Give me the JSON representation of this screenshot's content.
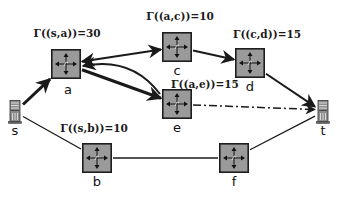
{
  "diagram": {
    "colors": {
      "router_fill": "#9a9a9a",
      "router_border": "#1e1e1e",
      "edge": "#1a1a1a",
      "server_fill": "#8c8c8c"
    },
    "nodes": [
      {
        "id": "s",
        "label": "s",
        "kind": "server",
        "icon": "server-icon"
      },
      {
        "id": "a",
        "label": "a",
        "kind": "router",
        "icon": "router-icon"
      },
      {
        "id": "c",
        "label": "c",
        "kind": "router",
        "icon": "router-icon"
      },
      {
        "id": "d",
        "label": "d",
        "kind": "router",
        "icon": "router-icon"
      },
      {
        "id": "e",
        "label": "e",
        "kind": "router",
        "icon": "router-icon"
      },
      {
        "id": "b",
        "label": "b",
        "kind": "router",
        "icon": "router-icon"
      },
      {
        "id": "f",
        "label": "f",
        "kind": "router",
        "icon": "router-icon"
      },
      {
        "id": "t",
        "label": "t",
        "kind": "server",
        "icon": "server-icon"
      }
    ],
    "capacity_labels": [
      {
        "edge": "s-a",
        "text": "Γ((s,a))=30"
      },
      {
        "edge": "a-c",
        "text": "Γ((a,c))=10"
      },
      {
        "edge": "c-d",
        "text": "Γ((c,d))=15"
      },
      {
        "edge": "a-e",
        "text": "Γ((a,e))=15"
      },
      {
        "edge": "s-b",
        "text": "Γ((s,b))=10"
      }
    ],
    "edges": [
      {
        "from": "s",
        "to": "a",
        "style": "thick-arrow"
      },
      {
        "from": "a",
        "to": "c",
        "style": "bidirectional-arrow"
      },
      {
        "from": "c",
        "to": "d",
        "style": "arrow"
      },
      {
        "from": "d",
        "to": "t",
        "style": "arrow"
      },
      {
        "from": "a",
        "to": "e",
        "style": "thick-arrow"
      },
      {
        "from": "e",
        "to": "a",
        "style": "curved-arrow"
      },
      {
        "from": "e",
        "to": "t",
        "style": "dash-dot-arrow"
      },
      {
        "from": "s",
        "to": "b",
        "style": "line"
      },
      {
        "from": "b",
        "to": "f",
        "style": "line"
      },
      {
        "from": "f",
        "to": "t",
        "style": "line"
      }
    ]
  }
}
